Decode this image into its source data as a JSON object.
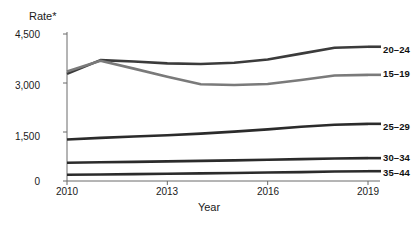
{
  "chart_data": {
    "type": "line",
    "title": "",
    "ylabel": "Rate*",
    "xlabel": "Year",
    "x": [
      2010,
      2011,
      2012,
      2013,
      2014,
      2015,
      2016,
      2017,
      2018,
      2019
    ],
    "xlim": [
      2010,
      2019
    ],
    "ylim": [
      0,
      4500
    ],
    "xticks": [
      "2010",
      "2013",
      "2016",
      "2019"
    ],
    "xtick_values": [
      2010,
      2013,
      2016,
      2019
    ],
    "yticks": [
      "0",
      "1,500",
      "3,000",
      "4,500"
    ],
    "ytick_values": [
      0,
      1500,
      3000,
      4500
    ],
    "grid": false,
    "legend_position": "right-inline-end-of-line",
    "series": [
      {
        "name": "20–24",
        "label": "20–24",
        "color": "#3b3b3b",
        "values": [
          3280,
          3700,
          3660,
          3600,
          3580,
          3620,
          3720,
          3900,
          4080,
          4110
        ]
      },
      {
        "name": "15–19",
        "label": "15–19",
        "color": "#7a7a7a",
        "values": [
          3350,
          3680,
          3440,
          3190,
          2960,
          2940,
          2970,
          3090,
          3230,
          3250
        ]
      },
      {
        "name": "25–29",
        "label": "25–29",
        "color": "#2b2b2b",
        "values": [
          1270,
          1320,
          1360,
          1400,
          1450,
          1510,
          1580,
          1660,
          1720,
          1750
        ]
      },
      {
        "name": "30–34",
        "label": "30–34",
        "color": "#2b2b2b",
        "values": [
          560,
          575,
          585,
          600,
          615,
          630,
          650,
          670,
          690,
          700
        ]
      },
      {
        "name": "35–44",
        "label": "35–44",
        "color": "#2b2b2b",
        "values": [
          190,
          200,
          210,
          220,
          232,
          245,
          258,
          272,
          290,
          300
        ]
      }
    ]
  },
  "axes": {
    "y_title": "Rate*",
    "x_title": "Year",
    "y_tick_labels": [
      "4,500",
      "3,000",
      "1,500",
      "0"
    ],
    "x_tick_labels": [
      "2010",
      "2013",
      "2016",
      "2019"
    ]
  },
  "legend": {
    "items": [
      {
        "label": "20–24"
      },
      {
        "label": "15–19"
      },
      {
        "label": "25–29"
      },
      {
        "label": "30–34"
      },
      {
        "label": "35–44"
      }
    ]
  },
  "colors": {
    "axis": "#6b6b6b",
    "line_dark": "#2b2b2b",
    "line_gray": "#7a7a7a",
    "text": "#1a1a1a"
  }
}
